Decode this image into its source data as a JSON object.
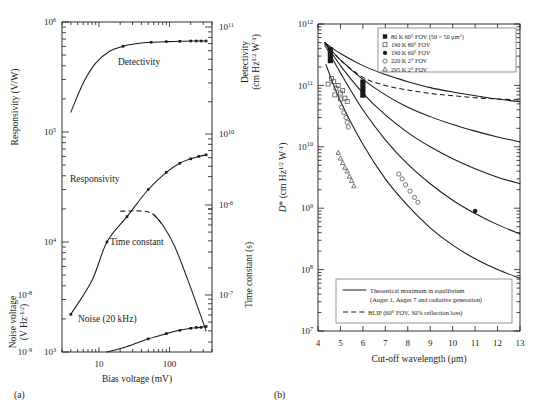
{
  "figure": {
    "panel_a_label": "(a)",
    "panel_b_label": "(b)"
  },
  "chart_data": [
    {
      "id": "panel_a",
      "type": "line",
      "title": "",
      "xlabel": "Bias voltage (mV)",
      "xscale": "log",
      "xlim": [
        3,
        400
      ],
      "xticklabels": [
        "10",
        "100"
      ],
      "xtickvalues": [
        10,
        100
      ],
      "left_axis_top": {
        "label": "Responsivity (V/W)",
        "ticklabels": [
          "10",
          "10",
          "10",
          "10"
        ],
        "exponents": [
          "6",
          "5",
          "4",
          "3"
        ],
        "ylim_exp": [
          3,
          6
        ]
      },
      "left_axis_bottom": {
        "label": "Noise voltage (V Hz",
        "label_exp": "-1/2",
        "label_end": ")",
        "ticklabels": [
          "10",
          "10"
        ],
        "exponents": [
          "-8",
          "-9"
        ]
      },
      "right_axis_top": {
        "label": "Detectivity (cm Hz",
        "label_exp": "1/2",
        "label_mid": " W",
        "label_exp2": "-1",
        "label_end": ")",
        "ticklabels": [
          "10",
          "10"
        ],
        "exponents": [
          "11",
          "10"
        ]
      },
      "right_axis_bottom": {
        "label": "Time constant (s)",
        "ticklabels": [
          "10",
          "10"
        ],
        "exponents": [
          "-6",
          "-7"
        ]
      },
      "series": [
        {
          "name": "Detectivity",
          "annotation": "Detectivity",
          "style": "solid",
          "marker": "filled-square",
          "x": [
            4,
            6,
            9,
            14,
            22,
            35,
            55,
            90,
            140,
            200,
            260,
            330
          ],
          "y_detectivity": [
            16000000000.0,
            30000000000.0,
            46000000000.0,
            59000000000.0,
            66000000000.0,
            70000000000.0,
            72000000000.0,
            73000000000.0,
            73500000000.0,
            74000000000.0,
            74000000000.0,
            74000000000.0
          ],
          "marker_x": [
            22,
            55,
            90,
            140,
            200,
            240,
            280,
            330
          ],
          "comment": "saturating curve, rises from 1.6e10 to plateau ~7.4e10"
        },
        {
          "name": "Responsivity",
          "annotation": "Responsivity",
          "style": "solid",
          "marker": "filled-square",
          "x": [
            4,
            8,
            13,
            25,
            50,
            90,
            140,
            200,
            260,
            330
          ],
          "y": [
            2200,
            4500,
            10000,
            17000,
            30000,
            43000,
            52000,
            57000,
            60000,
            62000
          ],
          "marker_x": [
            4,
            13,
            25,
            50,
            90,
            140,
            200,
            260,
            330
          ]
        },
        {
          "name": "Time constant",
          "annotation": "Time constant",
          "style": "dashed-then-solid",
          "marker": "none",
          "x": [
            20,
            30,
            45,
            60,
            80,
            120,
            200,
            330
          ],
          "y": [
            8.5e-07,
            8.6e-07,
            8.5e-07,
            7.8e-07,
            6e-07,
            3.4e-07,
            1.2e-07,
            4e-08
          ],
          "dashed_range": [
            20,
            80
          ]
        },
        {
          "name": "Noise (20 kHz)",
          "annotation": "Noise (20 kHz)",
          "style": "solid",
          "marker": "filled-square",
          "x": [
            13,
            25,
            50,
            90,
            140,
            200,
            260,
            330
          ],
          "y": [
            1e-09,
            1.25e-09,
            1.7e-09,
            2.1e-09,
            2.4e-09,
            2.6e-09,
            2.7e-09,
            2.8e-09
          ],
          "marker_x": [
            50,
            90,
            140,
            200,
            240,
            280,
            330
          ]
        }
      ]
    },
    {
      "id": "panel_b",
      "type": "scatter",
      "title": "",
      "xlabel": "Cut-off wavelength (μm)",
      "xscale": "linear",
      "xlim": [
        4,
        13
      ],
      "xticklabels": [
        "4",
        "5",
        "6",
        "7",
        "8",
        "9",
        "10",
        "11",
        "12",
        "13"
      ],
      "ylabel": "D* (cm Hz",
      "ylabel_exp": "1/2",
      "ylabel_mid": " W",
      "ylabel_exp2": "-1",
      "ylabel_end": ")",
      "yscale": "log",
      "ylim_exp": [
        7,
        12
      ],
      "yticklabels": [
        "10",
        "10",
        "10",
        "10",
        "10",
        "10"
      ],
      "yexponents": [
        "12",
        "11",
        "10",
        "9",
        "8",
        "7"
      ],
      "legend_top": {
        "position": "top-right",
        "entries": [
          {
            "marker": "filled-square",
            "label": "80 K 60° FOV (50 × 50 μm",
            "label_sup": "2",
            "label_end": ")"
          },
          {
            "marker": "open-square",
            "label": "190 K 80° FOV",
            "label_sup": "",
            "label_end": ""
          },
          {
            "marker": "filled-circle",
            "label": "190 K 60° FOV",
            "label_sup": "",
            "label_end": ""
          },
          {
            "marker": "open-circle",
            "label": "220 K 2° FOV",
            "label_sup": "",
            "label_end": ""
          },
          {
            "marker": "open-triangle",
            "label": "295 K 2° FOV",
            "label_sup": "",
            "label_end": ""
          }
        ]
      },
      "legend_bottom": {
        "position": "bottom-center",
        "entries": [
          {
            "style": "solid",
            "line1": "Theoretical maximum in equilibrium",
            "line2": "(Auger 1, Auger 7 and radiative generation)"
          },
          {
            "style": "dashed",
            "line1": "BLIP (60° FOV, 30% reflection loss)",
            "line2": ""
          }
        ]
      },
      "curves": [
        {
          "name": "theoretical-80K",
          "style": "solid",
          "x": [
            4.3,
            5,
            6,
            7,
            8,
            9,
            10,
            11,
            12,
            13
          ],
          "y": [
            500000000000.0,
            330000000000.0,
            210000000000.0,
            150000000000.0,
            115000000000.0,
            92000000000.0,
            78000000000.0,
            68000000000.0,
            60000000000.0,
            54000000000.0
          ]
        },
        {
          "name": "theoretical-curve-2",
          "style": "solid",
          "x": [
            4.3,
            5,
            6,
            7,
            8,
            9,
            10,
            11,
            12,
            13
          ],
          "y": [
            500000000000.0,
            260000000000.0,
            125000000000.0,
            70000000000.0,
            44000000000.0,
            31000000000.0,
            23000000000.0,
            18000000000.0,
            14500000000.0,
            12000000000.0
          ]
        },
        {
          "name": "theoretical-curve-3",
          "style": "solid",
          "x": [
            4.3,
            5,
            6,
            7,
            8,
            9,
            10,
            11,
            12,
            13
          ],
          "y": [
            500000000000.0,
            210000000000.0,
            75000000000.0,
            33000000000.0,
            17000000000.0,
            10000000000.0,
            6400000000.0,
            4400000000.0,
            3200000000.0,
            2500000000.0
          ]
        },
        {
          "name": "theoretical-curve-4",
          "style": "solid",
          "x": [
            4.3,
            5,
            6,
            7,
            8,
            9,
            10,
            11,
            12,
            13
          ],
          "y": [
            460000000000.0,
            160000000000.0,
            40000000000.0,
            13000000000.0,
            5200000000.0,
            2500000000.0,
            1350000000.0,
            820000000.0,
            540000000.0,
            380000000.0
          ]
        },
        {
          "name": "theoretical-curve-5",
          "style": "solid",
          "x": [
            4.35,
            5,
            6,
            7,
            8,
            9,
            10,
            11,
            12,
            13
          ],
          "y": [
            220000000000.0,
            55000000000.0,
            11000000000.0,
            3000000000.0,
            1100000000.0,
            480000000.0,
            250000000.0,
            150000000.0,
            100000000.0,
            72000000.0
          ]
        },
        {
          "name": "BLIP",
          "style": "dashed",
          "x": [
            4.3,
            5,
            6,
            7,
            8,
            9,
            10,
            11,
            12,
            13
          ],
          "y": [
            500000000000.0,
            260000000000.0,
            135000000000.0,
            100000000000.0,
            84000000000.0,
            74000000000.0,
            68000000000.0,
            63000000000.0,
            60000000000.0,
            58000000000.0
          ]
        }
      ],
      "points": [
        {
          "group": "80 K 60° FOV",
          "marker": "filled-bar",
          "x": 6.0,
          "y_low": 63000000000.0,
          "y_high": 125000000000.0
        },
        {
          "group": "80 K 60° FOV",
          "marker": "filled-bar",
          "x": 4.55,
          "y_low": 230000000000.0,
          "y_high": 420000000000.0
        },
        {
          "group": "190 K 80° FOV",
          "marker": "open-square",
          "x": 4.45,
          "y": 105000000000.0
        },
        {
          "group": "190 K 80° FOV",
          "marker": "open-square",
          "x": 4.6,
          "y": 130000000000.0
        },
        {
          "group": "190 K 80° FOV",
          "marker": "open-square",
          "x": 4.7,
          "y": 115000000000.0
        },
        {
          "group": "190 K 80° FOV",
          "marker": "open-square",
          "x": 4.8,
          "y": 90000000000.0
        },
        {
          "group": "190 K 80° FOV",
          "marker": "open-square",
          "x": 4.9,
          "y": 100000000000.0
        },
        {
          "group": "190 K 80° FOV",
          "marker": "open-square",
          "x": 5.0,
          "y": 75000000000.0
        },
        {
          "group": "190 K 80° FOV",
          "marker": "open-square",
          "x": 5.1,
          "y": 82000000000.0
        },
        {
          "group": "190 K 80° FOV",
          "marker": "open-square",
          "x": 5.2,
          "y": 62000000000.0
        },
        {
          "group": "190 K 80° FOV",
          "marker": "open-square",
          "x": 5.3,
          "y": 55000000000.0
        },
        {
          "group": "190 K 80° FOV",
          "marker": "open-square",
          "x": 5.0,
          "y": 60000000000.0
        },
        {
          "group": "190 K 80° FOV",
          "marker": "open-square",
          "x": 4.75,
          "y": 70000000000.0
        },
        {
          "group": "220 K 2° FOV",
          "marker": "open-circle",
          "x": 5.05,
          "y": 44000000000.0
        },
        {
          "group": "220 K 2° FOV",
          "marker": "open-circle",
          "x": 5.15,
          "y": 36000000000.0
        },
        {
          "group": "220 K 2° FOV",
          "marker": "open-circle",
          "x": 5.25,
          "y": 30000000000.0
        },
        {
          "group": "220 K 2° FOV",
          "marker": "open-circle",
          "x": 5.3,
          "y": 25000000000.0
        },
        {
          "group": "220 K 2° FOV",
          "marker": "open-circle",
          "x": 5.35,
          "y": 21000000000.0
        },
        {
          "group": "220 K 2° FOV",
          "marker": "open-circle",
          "x": 7.6,
          "y": 3600000000.0
        },
        {
          "group": "220 K 2° FOV",
          "marker": "open-circle",
          "x": 7.75,
          "y": 3000000000.0
        },
        {
          "group": "220 K 2° FOV",
          "marker": "open-circle",
          "x": 7.9,
          "y": 2400000000.0
        },
        {
          "group": "220 K 2° FOV",
          "marker": "open-circle",
          "x": 8.1,
          "y": 1900000000.0
        },
        {
          "group": "220 K 2° FOV",
          "marker": "open-circle",
          "x": 8.3,
          "y": 1500000000.0
        },
        {
          "group": "220 K 2° FOV",
          "marker": "open-circle",
          "x": 8.45,
          "y": 1250000000.0
        },
        {
          "group": "295 K 2° FOV",
          "marker": "open-triangle",
          "x": 4.9,
          "y": 8000000000.0
        },
        {
          "group": "295 K 2° FOV",
          "marker": "open-triangle",
          "x": 5.0,
          "y": 6500000000.0
        },
        {
          "group": "295 K 2° FOV",
          "marker": "open-triangle",
          "x": 5.1,
          "y": 5500000000.0
        },
        {
          "group": "295 K 2° FOV",
          "marker": "open-triangle",
          "x": 5.2,
          "y": 4600000000.0
        },
        {
          "group": "295 K 2° FOV",
          "marker": "open-triangle",
          "x": 5.3,
          "y": 4000000000.0
        },
        {
          "group": "295 K 2° FOV",
          "marker": "open-triangle",
          "x": 5.4,
          "y": 3300000000.0
        },
        {
          "group": "295 K 2° FOV",
          "marker": "open-triangle",
          "x": 5.5,
          "y": 2800000000.0
        },
        {
          "group": "295 K 2° FOV",
          "marker": "open-triangle",
          "x": 5.6,
          "y": 2300000000.0
        },
        {
          "group": "190 K 60° FOV",
          "marker": "filled-circle",
          "x": 11.0,
          "y": 900000000.0
        }
      ]
    }
  ]
}
